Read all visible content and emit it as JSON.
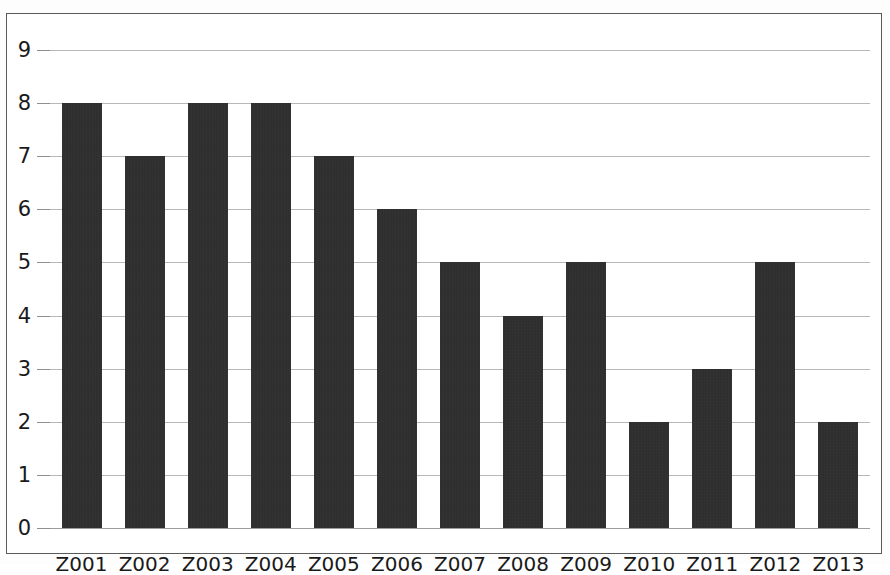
{
  "chart_data": {
    "type": "bar",
    "title": "",
    "subtitle": "",
    "xlabel": "",
    "ylabel": "",
    "categories": [
      "Z001",
      "Z002",
      "Z003",
      "Z004",
      "Z005",
      "Z006",
      "Z007",
      "Z008",
      "Z009",
      "Z010",
      "Z011",
      "Z012",
      "Z013"
    ],
    "values": [
      8,
      7,
      8,
      8,
      7,
      6,
      5,
      4,
      5,
      2,
      3,
      5,
      2
    ],
    "ylim": [
      0,
      9
    ],
    "ytick_labels": [
      "0",
      "1",
      "2",
      "3",
      "4",
      "5",
      "6",
      "7",
      "8",
      "9"
    ],
    "ytick_values": [
      0,
      1,
      2,
      3,
      4,
      5,
      6,
      7,
      8,
      9
    ],
    "grid": "horizontal",
    "legend": "none",
    "annotations": [],
    "bar_color": "#2b2b2b",
    "gridline_color": "#b8b8b8",
    "axis_color": "#8f8f8f",
    "background_color": "#ffffff",
    "border_color": "#5a5a5a"
  }
}
